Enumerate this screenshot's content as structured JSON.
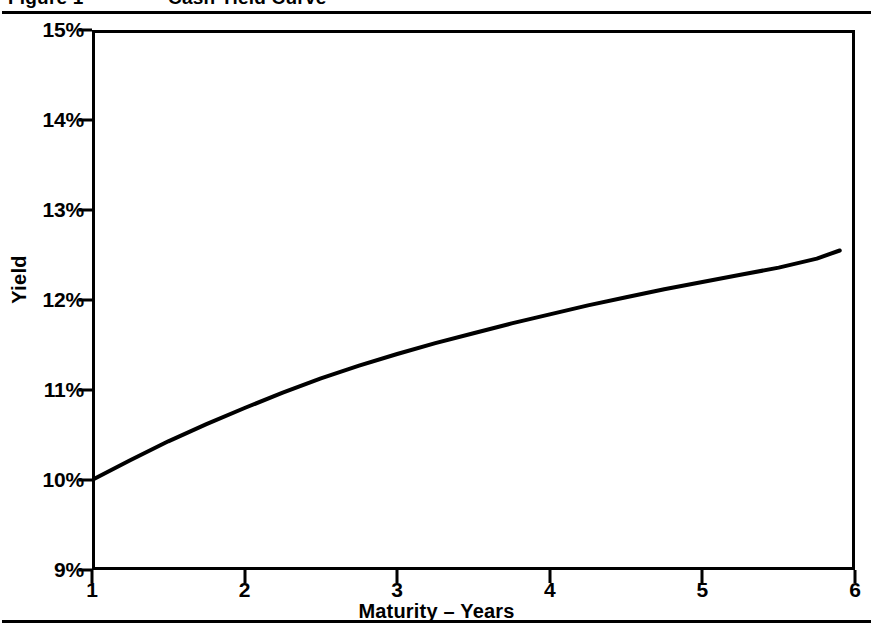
{
  "figure": {
    "label": "Figure 1",
    "title": "Cash Yield Curve"
  },
  "axes": {
    "y_title": "Yield",
    "x_title": "Maturity – Years"
  },
  "chart_data": {
    "type": "line",
    "title": "Cash Yield Curve",
    "xlabel": "Maturity – Years",
    "ylabel": "Yield",
    "xlim": [
      1,
      6
    ],
    "ylim": [
      9,
      15
    ],
    "grid": false,
    "legend": null,
    "x_tick_labels": [
      "1",
      "2",
      "3",
      "4",
      "5",
      "6"
    ],
    "x_tick_values": [
      1,
      2,
      3,
      4,
      5,
      6
    ],
    "y_tick_labels": [
      "9%",
      "10%",
      "11%",
      "12%",
      "13%",
      "14%",
      "15%"
    ],
    "y_tick_values": [
      9,
      10,
      11,
      12,
      13,
      14,
      15
    ],
    "line_color": "#000000",
    "line_width": 4,
    "series": [
      {
        "name": "Cash yield curve",
        "x": [
          1.0,
          1.25,
          1.5,
          1.75,
          2.0,
          2.25,
          2.5,
          2.75,
          3.0,
          3.25,
          3.5,
          3.75,
          4.0,
          4.25,
          4.5,
          4.75,
          5.0,
          5.25,
          5.5,
          5.75,
          5.9
        ],
        "values": [
          10.0,
          10.22,
          10.43,
          10.62,
          10.8,
          10.97,
          11.13,
          11.27,
          11.4,
          11.52,
          11.63,
          11.74,
          11.84,
          11.94,
          12.03,
          12.12,
          12.2,
          12.28,
          12.36,
          12.46,
          12.55
        ]
      }
    ]
  }
}
